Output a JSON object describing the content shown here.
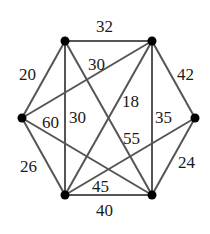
{
  "graph": {
    "vertices": [
      {
        "id": "A",
        "x": 65,
        "y": 41
      },
      {
        "id": "B",
        "x": 152,
        "y": 41
      },
      {
        "id": "C",
        "x": 195,
        "y": 118
      },
      {
        "id": "D",
        "x": 152,
        "y": 195
      },
      {
        "id": "E",
        "x": 65,
        "y": 195
      },
      {
        "id": "F",
        "x": 22,
        "y": 118
      }
    ],
    "edges": [
      {
        "from": "A",
        "to": "B",
        "weight": "32",
        "lx": 96,
        "ly": 32
      },
      {
        "from": "B",
        "to": "C",
        "weight": "42",
        "lx": 177,
        "ly": 80
      },
      {
        "from": "C",
        "to": "D",
        "weight": "24",
        "lx": 178,
        "ly": 168
      },
      {
        "from": "D",
        "to": "E",
        "weight": "40",
        "lx": 96,
        "ly": 216
      },
      {
        "from": "E",
        "to": "F",
        "weight": "26",
        "lx": 20,
        "ly": 172
      },
      {
        "from": "F",
        "to": "A",
        "weight": "20",
        "lx": 19,
        "ly": 80
      },
      {
        "from": "F",
        "to": "B",
        "weight": "30",
        "lx": 88,
        "ly": 70
      },
      {
        "from": "A",
        "to": "E",
        "weight": "30",
        "lx": 69,
        "ly": 123
      },
      {
        "from": "F",
        "to": "D",
        "weight": "60",
        "lx": 42,
        "ly": 128
      },
      {
        "from": "B",
        "to": "E",
        "weight": "18",
        "lx": 122,
        "ly": 107
      },
      {
        "from": "A",
        "to": "D",
        "weight": "55",
        "lx": 123,
        "ly": 144
      },
      {
        "from": "B",
        "to": "D",
        "weight": "35",
        "lx": 155,
        "ly": 123
      },
      {
        "from": "C",
        "to": "E",
        "weight": "45",
        "lx": 92,
        "ly": 192
      }
    ]
  }
}
